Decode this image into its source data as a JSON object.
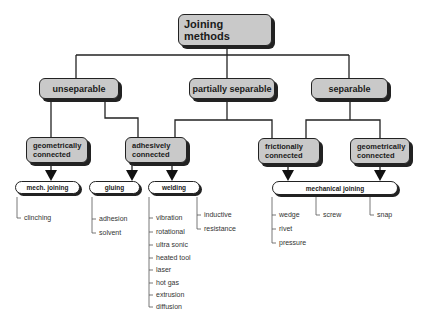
{
  "diagram": {
    "root": {
      "label": "Joining methods"
    },
    "level1": [
      {
        "id": "unseparable",
        "label": "unseparable"
      },
      {
        "id": "partially-separable",
        "label": "partially separable"
      },
      {
        "id": "separable",
        "label": "separable"
      }
    ],
    "level2": [
      {
        "id": "geometrically-connected-left",
        "line1": "geometrically",
        "line2": "connected"
      },
      {
        "id": "adhesively-connected",
        "line1": "adhesively",
        "line2": "connected"
      },
      {
        "id": "frictionally-connected",
        "line1": "frictionally",
        "line2": "connected"
      },
      {
        "id": "geometrically-connected-right",
        "line1": "geometrically",
        "line2": "connected"
      }
    ],
    "level3": [
      {
        "id": "mech-joining",
        "label": "mech. joining"
      },
      {
        "id": "gluing",
        "label": "gluing"
      },
      {
        "id": "welding",
        "label": "welding"
      },
      {
        "id": "mechanical-joining",
        "label": "mechanical joining"
      }
    ],
    "leaves": {
      "mech_joining": [
        "clinching"
      ],
      "gluing": [
        "adhesion",
        "solvent"
      ],
      "welding_a": [
        "vibration",
        "rotational",
        "ultra sonic",
        "heated tool",
        "laser",
        "hot gas",
        "extrusion",
        "diffusion"
      ],
      "welding_b": [
        "inductive",
        "resistance"
      ],
      "mechanical_a": [
        "wedge",
        "rivet",
        "pressure"
      ],
      "mechanical_b": [
        "screw"
      ],
      "mechanical_c": [
        "snap"
      ]
    }
  }
}
